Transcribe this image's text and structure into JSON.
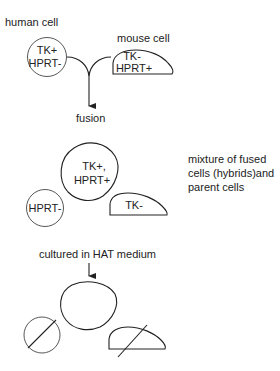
{
  "diagram": {
    "stage1": {
      "human_cell_label": "human cell",
      "human_cell_line1": "TK+",
      "human_cell_line2": "HPRT-",
      "mouse_cell_label": "mouse cell",
      "mouse_cell_line1": "TK-",
      "mouse_cell_line2": "HPRT+",
      "step_label": "fusion"
    },
    "stage2": {
      "hybrid_line1": "TK+,",
      "hybrid_line2": "HPRT+",
      "human_parent": "HPRT-",
      "mouse_parent": "TK-",
      "description_line1": "mixture of  fused",
      "description_line2": "cells (hybrids)and",
      "description_line3": "parent  cells"
    },
    "stage3": {
      "step_label": "cultured  in HAT medium"
    }
  }
}
